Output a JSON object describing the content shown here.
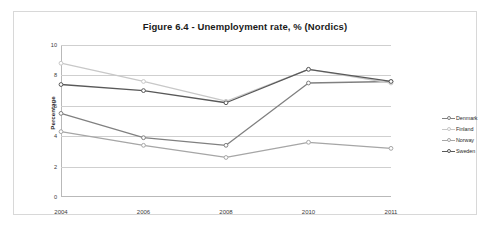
{
  "figure": {
    "title": "Figure 6.4 - Unemployment rate, % (Nordics)"
  },
  "chart_data": {
    "type": "line",
    "title": "Figure 6.4 - Unemployment rate, % (Nordics)",
    "xlabel": "",
    "ylabel": "Percentage",
    "categories": [
      "2004",
      "2006",
      "2008",
      "2010",
      "2011"
    ],
    "xticklabels": [
      "2004",
      "2006",
      "2008",
      "2010",
      "2011"
    ],
    "yticklabels": [
      "0",
      "2",
      "4",
      "6",
      "8",
      "10"
    ],
    "yticks": [
      0,
      2,
      4,
      6,
      8,
      10
    ],
    "ylim": [
      0,
      10
    ],
    "grid": "horizontal",
    "legend_position": "right",
    "series": [
      {
        "name": "Denmark",
        "color": "#808080",
        "marker": "circle",
        "values": [
          5.5,
          3.9,
          3.4,
          7.5,
          7.6
        ]
      },
      {
        "name": "Finland",
        "color": "#c8c8c8",
        "marker": "circle",
        "values": [
          8.8,
          7.6,
          6.3,
          8.4,
          7.5
        ]
      },
      {
        "name": "Norway",
        "color": "#a6a6a6",
        "marker": "circle",
        "values": [
          4.3,
          3.4,
          2.6,
          3.6,
          3.2
        ]
      },
      {
        "name": "Sweden",
        "color": "#595959",
        "marker": "circle",
        "values": [
          7.4,
          7.0,
          6.2,
          8.4,
          7.6
        ]
      }
    ]
  },
  "colors": {
    "frame_border": "#d8d8d8",
    "axis": "#b9b9b9",
    "gridline": "#cfcfcf",
    "background": "#ffffff",
    "text": "#2b2b2b"
  }
}
